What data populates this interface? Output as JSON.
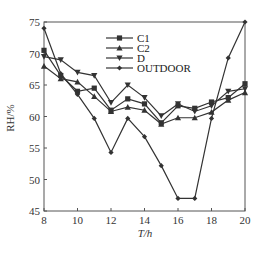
{
  "chart_data": {
    "type": "line",
    "title": "",
    "xlabel": "T/h",
    "ylabel": "RH/%",
    "xlim": [
      8,
      20
    ],
    "ylim": [
      45,
      75
    ],
    "xticks": [
      8,
      10,
      12,
      14,
      16,
      18,
      20
    ],
    "yticks": [
      45,
      50,
      55,
      60,
      65,
      70,
      75
    ],
    "grid": false,
    "legend_position": "top-center",
    "x": [
      8,
      9,
      10,
      11,
      12,
      13,
      14,
      15,
      16,
      17,
      18,
      19,
      20
    ],
    "series": [
      {
        "name": "C1",
        "marker": "square",
        "values": [
          70.5,
          66.5,
          64.0,
          64.5,
          61.0,
          62.8,
          62.0,
          59.0,
          61.7,
          61.3,
          62.3,
          63.0,
          65.2
        ]
      },
      {
        "name": "C2",
        "marker": "triangle-up",
        "values": [
          68.0,
          66.0,
          65.5,
          63.2,
          60.8,
          61.5,
          61.0,
          58.8,
          59.8,
          59.8,
          60.7,
          62.6,
          63.8
        ]
      },
      {
        "name": "D",
        "marker": "triangle-down",
        "values": [
          69.5,
          69.0,
          67.0,
          66.5,
          62.2,
          65.0,
          63.0,
          60.1,
          62.0,
          60.8,
          61.7,
          64.0,
          64.4
        ]
      },
      {
        "name": "OUTDOOR",
        "marker": "diamond",
        "values": [
          74.0,
          66.8,
          63.5,
          59.7,
          54.3,
          59.7,
          56.8,
          52.2,
          47.0,
          47.0,
          59.7,
          69.3,
          75.0
        ]
      }
    ],
    "colors": {
      "line": "#333333",
      "axis": "#555555"
    }
  }
}
